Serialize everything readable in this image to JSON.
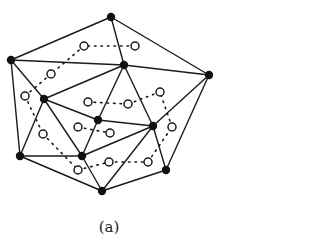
{
  "caption": "(a)",
  "colors": {
    "stroke": "#1a1a1a",
    "fill": "#111111",
    "background": "#ffffff"
  },
  "vertices": [
    {
      "id": "A",
      "x": 111,
      "y": 17
    },
    {
      "id": "B",
      "x": 11,
      "y": 60
    },
    {
      "id": "C",
      "x": 124,
      "y": 65
    },
    {
      "id": "D",
      "x": 209,
      "y": 75
    },
    {
      "id": "E",
      "x": 44,
      "y": 99
    },
    {
      "id": "F",
      "x": 98,
      "y": 120
    },
    {
      "id": "G",
      "x": 153,
      "y": 126
    },
    {
      "id": "H",
      "x": 20,
      "y": 156
    },
    {
      "id": "I",
      "x": 82,
      "y": 156
    },
    {
      "id": "J",
      "x": 166,
      "y": 170
    },
    {
      "id": "K",
      "x": 102,
      "y": 191
    }
  ],
  "edges": [
    [
      "A",
      "B"
    ],
    [
      "A",
      "C"
    ],
    [
      "A",
      "D"
    ],
    [
      "B",
      "C"
    ],
    [
      "C",
      "D"
    ],
    [
      "B",
      "E"
    ],
    [
      "B",
      "H"
    ],
    [
      "E",
      "C"
    ],
    [
      "E",
      "F"
    ],
    [
      "E",
      "H"
    ],
    [
      "E",
      "I"
    ],
    [
      "C",
      "F"
    ],
    [
      "C",
      "G"
    ],
    [
      "D",
      "G"
    ],
    [
      "D",
      "J"
    ],
    [
      "F",
      "G"
    ],
    [
      "F",
      "I"
    ],
    [
      "G",
      "I"
    ],
    [
      "G",
      "J"
    ],
    [
      "G",
      "K"
    ],
    [
      "I",
      "H"
    ],
    [
      "I",
      "K"
    ],
    [
      "H",
      "K"
    ],
    [
      "K",
      "J"
    ]
  ],
  "hollow_nodes": [
    {
      "id": "p1",
      "x": 84,
      "y": 46
    },
    {
      "id": "p2",
      "x": 135,
      "y": 46
    },
    {
      "id": "p3",
      "x": 51,
      "y": 74
    },
    {
      "id": "p4",
      "x": 25,
      "y": 96
    },
    {
      "id": "p5",
      "x": 88,
      "y": 102
    },
    {
      "id": "p6",
      "x": 128,
      "y": 104
    },
    {
      "id": "p7",
      "x": 160,
      "y": 92
    },
    {
      "id": "p8",
      "x": 78,
      "y": 127
    },
    {
      "id": "p9",
      "x": 110,
      "y": 133
    },
    {
      "id": "p10",
      "x": 43,
      "y": 134
    },
    {
      "id": "p11",
      "x": 172,
      "y": 127
    },
    {
      "id": "p12",
      "x": 78,
      "y": 170
    },
    {
      "id": "p13",
      "x": 109,
      "y": 162
    },
    {
      "id": "p14",
      "x": 148,
      "y": 162
    }
  ],
  "dotted_links": [
    [
      "p2",
      "p1"
    ],
    [
      "p1",
      "p3"
    ],
    [
      "p3",
      "p4"
    ],
    [
      "p4",
      "p10"
    ],
    [
      "p10",
      "p12"
    ],
    [
      "p12",
      "p13"
    ],
    [
      "p13",
      "p14"
    ],
    [
      "p14",
      "p11"
    ],
    [
      "p11",
      "p7"
    ],
    [
      "p7",
      "p6"
    ],
    [
      "p6",
      "p5"
    ],
    [
      "p8",
      "p9"
    ]
  ]
}
